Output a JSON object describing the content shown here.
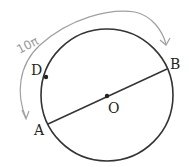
{
  "diagram": {
    "points": {
      "A": "A",
      "B": "B",
      "O": "O",
      "D": "D"
    },
    "arc_label": "10π",
    "colors": {
      "circle": "#333333",
      "arc_annotation": "#9a9a9a"
    }
  }
}
